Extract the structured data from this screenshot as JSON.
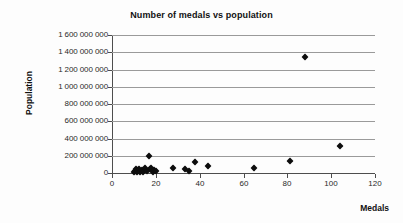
{
  "chart_data": {
    "type": "scatter",
    "title": "Number of medals vs population",
    "xlabel": "Medals",
    "ylabel": "Population",
    "xlim": [
      0,
      120
    ],
    "ylim": [
      0,
      1600000000
    ],
    "grid": "horizontal",
    "legend": "none",
    "marker": "diamond",
    "marker_color": "#0d0d0d",
    "gridline_color": "#9a9a9a",
    "axis_color": "#4d4d4d",
    "background_color": "#fdfdfd",
    "x_ticks": [
      0,
      20,
      40,
      60,
      80,
      100,
      120
    ],
    "x_tick_labels": [
      "0",
      "20",
      "40",
      "60",
      "80",
      "100",
      "120"
    ],
    "y_ticks": [
      0,
      200000000,
      400000000,
      600000000,
      800000000,
      1000000000,
      1200000000,
      1400000000,
      1600000000
    ],
    "y_tick_labels": [
      "0",
      "200 000 000",
      "400 000 000",
      "600 000 000",
      "800 000 000",
      "1 000 000 000",
      "1 200 000 000",
      "1 400 000 000",
      "1 600 000 000"
    ],
    "points": [
      {
        "x": 10.0,
        "y": 11000000
      },
      {
        "x": 10.5,
        "y": 23000000
      },
      {
        "x": 11.0,
        "y": 46000000
      },
      {
        "x": 11.5,
        "y": 9000000
      },
      {
        "x": 12.0,
        "y": 31000000
      },
      {
        "x": 12.5,
        "y": 50000000
      },
      {
        "x": 13.0,
        "y": 16000000
      },
      {
        "x": 13.5,
        "y": 38000000
      },
      {
        "x": 14.0,
        "y": 8000000
      },
      {
        "x": 15.0,
        "y": 62000000
      },
      {
        "x": 16.0,
        "y": 22000000
      },
      {
        "x": 17.0,
        "y": 196000000
      },
      {
        "x": 17.5,
        "y": 46000000
      },
      {
        "x": 18.0,
        "y": 60000000
      },
      {
        "x": 18.5,
        "y": 10000000
      },
      {
        "x": 19.0,
        "y": 36000000
      },
      {
        "x": 20.0,
        "y": 23000000
      },
      {
        "x": 28.0,
        "y": 60000000
      },
      {
        "x": 33.5,
        "y": 46000000
      },
      {
        "x": 35.0,
        "y": 21000000
      },
      {
        "x": 38.0,
        "y": 127000000
      },
      {
        "x": 44.0,
        "y": 82000000
      },
      {
        "x": 65.0,
        "y": 63000000
      },
      {
        "x": 81.0,
        "y": 138000000
      },
      {
        "x": 88.0,
        "y": 1345000000
      },
      {
        "x": 104.0,
        "y": 315000000
      }
    ]
  }
}
